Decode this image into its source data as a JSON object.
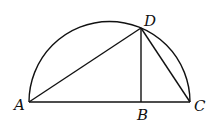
{
  "figure": {
    "type": "semicircle-geometry",
    "labels": {
      "A": "A",
      "B": "B",
      "C": "C",
      "D": "D"
    },
    "points": {
      "A": [
        29,
        102
      ],
      "B": [
        142,
        102
      ],
      "C": [
        190,
        102
      ],
      "D": [
        141,
        28
      ]
    },
    "segments": [
      "AC",
      "AD",
      "DB",
      "DC"
    ],
    "arc": "semicircle on diameter AC",
    "colors": {
      "stroke": "#111111",
      "background": "#ffffff"
    }
  }
}
